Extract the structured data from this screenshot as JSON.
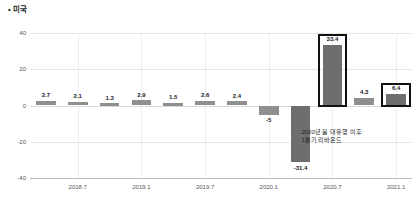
{
  "chart_data": {
    "type": "bar",
    "title": "• 미국",
    "xlabel": "",
    "ylabel": "",
    "ylim": [
      -40,
      40
    ],
    "yticks": [
      40,
      20,
      0,
      -20,
      -40
    ],
    "ytick_labels": [
      "40",
      "20",
      "0",
      "-20",
      "-40"
    ],
    "grid": true,
    "legend": "none",
    "categories": [
      "",
      "2018.7",
      "",
      "2019.1",
      "",
      "2019.7",
      "",
      "2020.1",
      "",
      "2020.7",
      "",
      "2021.1"
    ],
    "xtick_labels": [
      "2018.7",
      "2019.1",
      "2019.7",
      "2020.1",
      "2020.7",
      "2021.1"
    ],
    "values": [
      2.7,
      2.1,
      1.3,
      2.9,
      1.5,
      2.6,
      2.4,
      -5,
      -31.4,
      33.4,
      4.3,
      6.4
    ],
    "value_labels": [
      "2.7",
      "2.1",
      "1.3",
      "2.9",
      "1.5",
      "2.6",
      "2.4",
      "-5",
      "-31.4",
      "33.4",
      "4.3",
      "6.4"
    ],
    "highlighted_indices": [
      9,
      11
    ],
    "annotations": [
      {
        "text": "2020년 봄 대유행 이후\n1분기 리바운드",
        "near_index": 9
      }
    ],
    "colors": {
      "bar": "#8f8f8f",
      "bar_dark": "#6e6e6e",
      "highlight_outline": "#111111",
      "grid": "#e6e6e6",
      "axis": "#bdbdbd",
      "text": "#333333"
    }
  }
}
